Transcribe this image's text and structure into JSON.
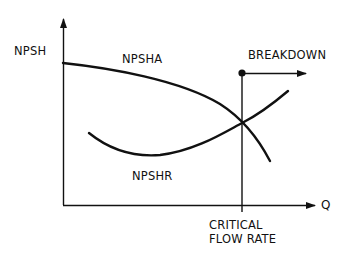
{
  "diagram": {
    "type": "pump NPSH curve diagram",
    "axes": {
      "y_label": "NPSH",
      "x_label": "Q"
    },
    "curves": [
      {
        "name": "NPSHA",
        "label": "NPSHA",
        "description": "Net positive suction head available, decreasing with flow"
      },
      {
        "name": "NPSHR",
        "label": "NPSHR",
        "description": "Net positive suction head required, U-shaped rising with flow"
      }
    ],
    "annotations": {
      "breakdown": "BREAKDOWN",
      "critical_line1": "CRITICAL",
      "critical_line2": "FLOW RATE"
    },
    "colors": {
      "line": "#111111",
      "background": "#ffffff"
    }
  }
}
